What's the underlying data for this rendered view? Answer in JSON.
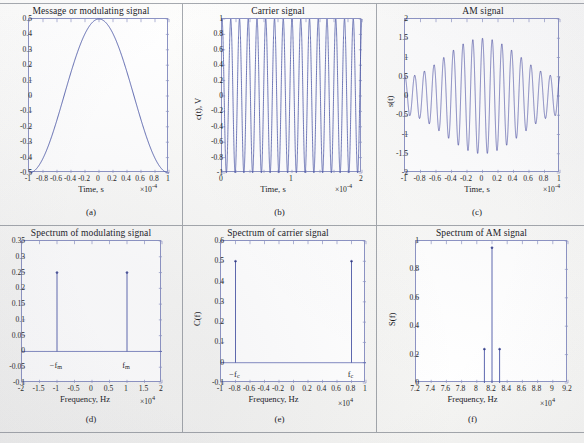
{
  "figure": {
    "rows": 2,
    "cols": 3,
    "background": "#fbfbfa",
    "line_color": "#4a56a6",
    "axis_color": "#8c93c4",
    "am_color": "#1a1f8c"
  },
  "panels": [
    {
      "id": "a",
      "caption": "(a)",
      "title": "Message or modulating signal",
      "xlabel": "Time, s",
      "ylabel": "",
      "x_exponent": "×10",
      "x_exponent_sup": "-4",
      "xticks": [
        "-1",
        "-0.8",
        "-0.6",
        "-0.4",
        "-0.2",
        "0",
        "0.2",
        "0.4",
        "0.6",
        "0.8",
        "1"
      ],
      "yticks": [
        "0.5",
        "0.4",
        "0.3",
        "0.2",
        "0.1",
        "0",
        "-0.1",
        "-0.2",
        "-0.3",
        "-0.4",
        "-0.5"
      ],
      "annotations": []
    },
    {
      "id": "b",
      "caption": "(b)",
      "title": "Carrier signal",
      "xlabel": "Time, s",
      "ylabel": "c(t), V",
      "x_exponent": "×10",
      "x_exponent_sup": "-4",
      "xticks": [
        "0",
        "1",
        "2"
      ],
      "yticks": [
        "1",
        "0.8",
        "0.6",
        "0.4",
        "0.2",
        "0",
        "-0.2",
        "-0.4",
        "-0.6",
        "-0.8",
        "-1"
      ],
      "annotations": []
    },
    {
      "id": "c",
      "caption": "(c)",
      "title": "AM signal",
      "xlabel": "Time, s",
      "ylabel": "s(t)",
      "x_exponent": "×10",
      "x_exponent_sup": "-4",
      "xticks": [
        "-1",
        "-0.8",
        "-0.6",
        "-0.4",
        "-0.2",
        "0",
        "0.2",
        "0.4",
        "0.6",
        "0.8",
        "1"
      ],
      "yticks": [
        "2",
        "1.5",
        "1",
        "0.5",
        "0",
        "-0.5",
        "-1",
        "-1.5",
        "-2"
      ],
      "annotations": []
    },
    {
      "id": "d",
      "caption": "(d)",
      "title": "Spectrum of modulating signal",
      "xlabel": "Frequency, Hz",
      "ylabel": "",
      "x_exponent": "×10",
      "x_exponent_sup": "4",
      "xticks": [
        "-2",
        "-1.5",
        "-1",
        "-0.5",
        "0",
        "0.5",
        "1",
        "1.5",
        "2"
      ],
      "yticks": [
        "0.35",
        "0.3",
        "0.25",
        "0.2",
        "0.15",
        "0.1",
        "0.05",
        "0",
        "-0.05",
        "-0.1"
      ],
      "annotations": [
        {
          "text": "−f",
          "sub": "m",
          "x": -1.0,
          "y": -0.035
        },
        {
          "text": "f",
          "sub": "m",
          "x": 1.0,
          "y": -0.035
        }
      ]
    },
    {
      "id": "e",
      "caption": "(e)",
      "title": "Spectrum of carrier signal",
      "xlabel": "Frequency, Hz",
      "ylabel": "C(f)",
      "x_exponent": "×10",
      "x_exponent_sup": "4",
      "xticks": [
        "-1",
        "-0.8",
        "-0.6",
        "-0.4",
        "-0.2",
        "0",
        "0.2",
        "0.4",
        "0.6",
        "0.8",
        "1"
      ],
      "yticks": [
        "0.6",
        "0.5",
        "0.4",
        "0.3",
        "0.2",
        "0.1",
        "0",
        "-0.1"
      ],
      "annotations": [
        {
          "text": "−f",
          "sub": "c",
          "x": -0.8,
          "y": -0.04
        },
        {
          "text": "f",
          "sub": "c",
          "x": 0.8,
          "y": -0.04
        }
      ]
    },
    {
      "id": "f",
      "caption": "(f)",
      "title": "Spectrum of AM signal",
      "xlabel": "Frequency, Hz",
      "ylabel": "S(f)",
      "x_exponent": "×10",
      "x_exponent_sup": "4",
      "xticks": [
        "7.2",
        "7.4",
        "7.6",
        "7.8",
        "8",
        "8.2",
        "8.4",
        "8.6",
        "8.8",
        "9",
        "9.2"
      ],
      "yticks": [
        "1",
        "0.8",
        "0.6",
        "0.4",
        "0.2",
        "0"
      ],
      "annotations": []
    }
  ],
  "chart_data": [
    {
      "type": "line",
      "panel": "a",
      "title": "Message or modulating signal",
      "xlabel": "Time, s",
      "ylabel": "m(t), V",
      "x_scale": 0.0001,
      "xlim": [
        -1,
        1
      ],
      "ylim": [
        -0.5,
        0.5
      ],
      "grid": false,
      "waveform": "cosine",
      "amplitude": 0.5,
      "frequency_hz": 10000,
      "cycles_in_view": 2,
      "x": [
        -1,
        -0.75,
        -0.5,
        -0.25,
        0,
        0.25,
        0.5,
        0.75,
        1
      ],
      "y": [
        0.5,
        0,
        -0.5,
        0,
        0.5,
        0,
        -0.5,
        0,
        0.5
      ]
    },
    {
      "type": "line",
      "panel": "b",
      "title": "Carrier signal",
      "xlabel": "Time, s",
      "ylabel": "c(t), V",
      "x_scale": 0.0001,
      "xlim": [
        0,
        2
      ],
      "ylim": [
        -1,
        1
      ],
      "grid": false,
      "waveform": "cosine",
      "amplitude": 1,
      "frequency_hz": 80000,
      "cycles_in_view": 16
    },
    {
      "type": "line",
      "panel": "c",
      "title": "AM signal",
      "xlabel": "Time, s",
      "ylabel": "s(t)",
      "x_scale": 0.0001,
      "xlim": [
        -1,
        1
      ],
      "ylim": [
        -2,
        2
      ],
      "grid": false,
      "waveform": "am",
      "carrier_amplitude": 1,
      "modulation_index": 0.5,
      "carrier_hz": 80000,
      "message_hz": 10000,
      "envelope_max": 1.5,
      "envelope_min": 0.5
    },
    {
      "type": "stem",
      "panel": "d",
      "title": "Spectrum of modulating signal",
      "xlabel": "Frequency, Hz",
      "ylabel": "M(f)",
      "x_scale": 10000.0,
      "xlim": [
        -2,
        2
      ],
      "ylim": [
        -0.1,
        0.35
      ],
      "grid": false,
      "x": [
        -1,
        1
      ],
      "y": [
        0.25,
        0.25
      ],
      "labels": [
        "−f_m",
        "f_m"
      ]
    },
    {
      "type": "stem",
      "panel": "e",
      "title": "Spectrum of carrier signal",
      "xlabel": "Frequency, Hz",
      "ylabel": "C(f)",
      "x_scale": 10000.0,
      "xlim": [
        -1,
        1
      ],
      "ylim": [
        -0.1,
        0.6
      ],
      "grid": false,
      "x": [
        -0.8,
        0.8
      ],
      "y": [
        0.5,
        0.5
      ],
      "labels": [
        "−f_c",
        "f_c"
      ]
    },
    {
      "type": "stem",
      "panel": "f",
      "title": "Spectrum of AM signal",
      "xlabel": "Frequency, Hz",
      "ylabel": "S(f)",
      "x_scale": 10000.0,
      "xlim": [
        7.2,
        9.2
      ],
      "ylim": [
        0,
        1.05
      ],
      "grid": false,
      "x": [
        8.1,
        8.2,
        8.3
      ],
      "y": [
        0.25,
        1.0,
        0.25
      ],
      "labels": [
        "lower sideband",
        "carrier",
        "upper sideband"
      ]
    }
  ]
}
